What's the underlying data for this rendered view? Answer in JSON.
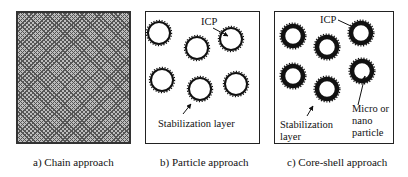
{
  "figure": {
    "panels": [
      {
        "id": "a",
        "caption": "a) Chain approach",
        "pattern": "dense hatched chain texture"
      },
      {
        "id": "b",
        "caption": "b) Particle approach",
        "labels": {
          "icp": "ICP",
          "stabilization": "Stabilization layer"
        },
        "particles": [
          {
            "cx": 159,
            "cy": 33
          },
          {
            "cx": 197,
            "cy": 48
          },
          {
            "cx": 231,
            "cy": 39
          },
          {
            "cx": 162,
            "cy": 80
          },
          {
            "cx": 200,
            "cy": 89
          },
          {
            "cx": 236,
            "cy": 84
          }
        ]
      },
      {
        "id": "c",
        "caption": "c) Core-shell approach",
        "labels": {
          "icp": "ICP",
          "stabilization_line1": "Stabilization",
          "stabilization_line2": "layer",
          "core_line1": "Micro or",
          "core_line2": "nano",
          "core_line3": "particle"
        },
        "particles": [
          {
            "cx": 293,
            "cy": 36
          },
          {
            "cx": 327,
            "cy": 47
          },
          {
            "cx": 361,
            "cy": 33
          },
          {
            "cx": 293,
            "cy": 76
          },
          {
            "cx": 327,
            "cy": 89
          },
          {
            "cx": 362,
            "cy": 71
          }
        ]
      }
    ],
    "colors": {
      "ink": "#111111",
      "border": "#222222",
      "hatch_bg": "#bdbdbd"
    }
  }
}
